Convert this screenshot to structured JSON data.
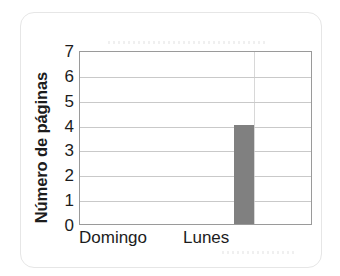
{
  "chart_data": {
    "type": "bar",
    "title": "",
    "xlabel": "",
    "ylabel": "Número de páginas",
    "categories": [
      "Domingo",
      "Lunes"
    ],
    "values": [
      0,
      4
    ],
    "yticks": [
      0,
      1,
      2,
      3,
      4,
      5,
      6,
      7
    ],
    "ylim": [
      0,
      7
    ],
    "grid": true,
    "legend": false,
    "bar_color": "#808080",
    "axis_color": "#9a9a9a",
    "gridline_color": "#c9c9c9",
    "text_color": "#1c1c1c",
    "background": "#ffffff"
  }
}
